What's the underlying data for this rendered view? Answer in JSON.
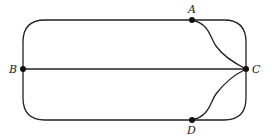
{
  "diagram": {
    "type": "graph",
    "nodes": [
      {
        "id": "A",
        "label": "A",
        "x": 192,
        "y": 20
      },
      {
        "id": "B",
        "label": "B",
        "x": 23,
        "y": 69
      },
      {
        "id": "C",
        "label": "C",
        "x": 246,
        "y": 69
      },
      {
        "id": "D",
        "label": "D",
        "x": 192,
        "y": 120
      }
    ],
    "edges": [
      {
        "from": "B",
        "to": "A",
        "shape": "rounded-top-left-outer"
      },
      {
        "from": "A",
        "to": "C",
        "shape": "rounded-top-right-outer"
      },
      {
        "from": "A",
        "to": "C",
        "shape": "inner-s-curve"
      },
      {
        "from": "B",
        "to": "C",
        "shape": "straight"
      },
      {
        "from": "B",
        "to": "D",
        "shape": "rounded-bottom-left-outer"
      },
      {
        "from": "D",
        "to": "C",
        "shape": "rounded-bottom-right-outer"
      },
      {
        "from": "D",
        "to": "C",
        "shape": "inner-s-curve"
      }
    ],
    "colors": {
      "line": "#222222",
      "node": "#111111"
    }
  }
}
